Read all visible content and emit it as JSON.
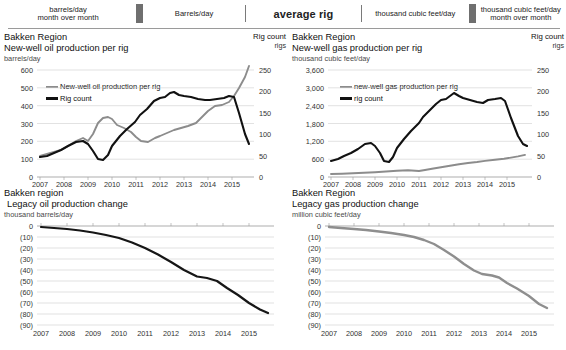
{
  "ribbon": {
    "cells": [
      {
        "label": "barrels/day\nmonth over month",
        "emphasis": false
      },
      {
        "label": "Barrels/day",
        "emphasis": false
      },
      {
        "label": "average rig",
        "emphasis": true
      },
      {
        "label": "thousand cubic feet/day",
        "emphasis": false
      },
      {
        "label": "thousand cubic feet/day\nmonth over month",
        "emphasis": false
      }
    ]
  },
  "panels": {
    "top_left": {
      "region": "Bakken Region",
      "title": "New-well oil production per rig",
      "unit": "barrels/day",
      "corner_title": "Rig count",
      "corner_unit": "rigs",
      "legend": [
        {
          "label": "New-well oil production per rig",
          "color": "#8c8c8c"
        },
        {
          "label": "Rig count",
          "color": "#111111"
        }
      ]
    },
    "top_right": {
      "region": "Bakken Region",
      "title": "New-well gas production per rig",
      "unit": "thousand cubic feet/day",
      "corner_title": "Rig count",
      "corner_unit": "rigs",
      "legend": [
        {
          "label": "new-well gas production per rig",
          "color": "#8c8c8c"
        },
        {
          "label": "rig count",
          "color": "#111111"
        }
      ]
    },
    "bottom_left": {
      "region": "Bakken region",
      "title": "Legacy oil production change",
      "unit": "thousand barrels/day"
    },
    "bottom_right": {
      "region": "Bakken Region",
      "title": "Legacy gas production change",
      "unit": "million cubic feet/day"
    }
  },
  "chart_data": [
    {
      "id": "new-well-oil-per-rig",
      "type": "line",
      "title": "Bakken Region New-well oil production per rig",
      "xlabel": "",
      "ylabel": "barrels/day",
      "y2label": "rigs",
      "xlim": [
        2007,
        2015.75
      ],
      "ylim": [
        0,
        600
      ],
      "y2lim": [
        0,
        250
      ],
      "xticks": [
        "2007",
        "2008",
        "2009",
        "2010",
        "2011",
        "2012",
        "2013",
        "2014",
        "2015"
      ],
      "yticks": [
        0,
        100,
        200,
        300,
        400,
        500,
        600
      ],
      "y2ticks": [
        0,
        50,
        100,
        150,
        200,
        250
      ],
      "grid": true,
      "legend_position": "upper-left",
      "series": [
        {
          "name": "New-well oil production per rig",
          "axis": "left",
          "color": "#8c8c8c",
          "x": [
            2007.0,
            2007.3,
            2007.6,
            2007.9,
            2008.2,
            2008.5,
            2008.8,
            2009.0,
            2009.2,
            2009.4,
            2009.6,
            2009.8,
            2010.0,
            2010.2,
            2010.5,
            2010.8,
            2011.0,
            2011.2,
            2011.5,
            2011.8,
            2012.0,
            2012.3,
            2012.6,
            2012.9,
            2013.2,
            2013.5,
            2013.8,
            2014.0,
            2014.3,
            2014.6,
            2014.9,
            2015.1,
            2015.3,
            2015.5,
            2015.7
          ],
          "y": [
            118,
            128,
            140,
            150,
            175,
            200,
            215,
            200,
            240,
            300,
            330,
            335,
            320,
            290,
            270,
            250,
            225,
            200,
            195,
            215,
            230,
            245,
            262,
            275,
            285,
            300,
            340,
            370,
            400,
            405,
            420,
            455,
            500,
            560,
            620
          ]
        },
        {
          "name": "Rig count",
          "axis": "right",
          "color": "#111111",
          "x": [
            2007.0,
            2007.3,
            2007.6,
            2007.9,
            2008.2,
            2008.5,
            2008.8,
            2009.0,
            2009.2,
            2009.4,
            2009.6,
            2009.8,
            2010.0,
            2010.3,
            2010.6,
            2010.9,
            2011.1,
            2011.4,
            2011.7,
            2012.0,
            2012.2,
            2012.4,
            2012.6,
            2012.8,
            2013.0,
            2013.3,
            2013.6,
            2013.9,
            2014.1,
            2014.4,
            2014.7,
            2014.9,
            2015.1,
            2015.3,
            2015.5,
            2015.7
          ],
          "y": [
            47,
            50,
            55,
            62,
            72,
            82,
            85,
            78,
            60,
            42,
            40,
            52,
            72,
            95,
            112,
            128,
            145,
            160,
            178,
            185,
            188,
            195,
            198,
            192,
            190,
            186,
            182,
            180,
            180,
            182,
            184,
            190,
            188,
            150,
            100,
            78
          ]
        }
      ]
    },
    {
      "id": "new-well-gas-per-rig",
      "type": "line",
      "title": "Bakken Region New-well gas production per rig",
      "xlabel": "",
      "ylabel": "thousand cubic feet/day",
      "y2label": "rigs",
      "xlim": [
        2007,
        2015.75
      ],
      "ylim": [
        0,
        3600
      ],
      "y2lim": [
        0,
        250
      ],
      "xticks": [
        "2007",
        "2008",
        "2009",
        "2010",
        "2011",
        "2012",
        "2013",
        "2014",
        "2015"
      ],
      "yticks": [
        0,
        600,
        1200,
        1800,
        2400,
        3000,
        3600
      ],
      "y2ticks": [
        0,
        50,
        100,
        150,
        200,
        250
      ],
      "grid": true,
      "legend_position": "upper-left",
      "series": [
        {
          "name": "new-well gas production per rig",
          "axis": "left",
          "color": "#8c8c8c",
          "x": [
            2007.0,
            2007.5,
            2008.0,
            2008.5,
            2009.0,
            2009.5,
            2010.0,
            2010.5,
            2011.0,
            2011.3,
            2011.6,
            2012.0,
            2012.4,
            2012.8,
            2013.2,
            2013.6,
            2014.0,
            2014.4,
            2014.8,
            2015.1,
            2015.4,
            2015.7
          ],
          "y": [
            100,
            110,
            125,
            140,
            160,
            185,
            210,
            225,
            200,
            230,
            280,
            330,
            380,
            430,
            470,
            500,
            540,
            580,
            610,
            650,
            690,
            740
          ]
        },
        {
          "name": "rig count",
          "axis": "right",
          "color": "#111111",
          "x": [
            2007.0,
            2007.3,
            2007.6,
            2007.9,
            2008.2,
            2008.5,
            2008.8,
            2009.0,
            2009.2,
            2009.4,
            2009.6,
            2009.8,
            2010.0,
            2010.3,
            2010.6,
            2010.9,
            2011.1,
            2011.4,
            2011.7,
            2012.0,
            2012.2,
            2012.4,
            2012.6,
            2012.8,
            2013.0,
            2013.3,
            2013.6,
            2013.9,
            2014.1,
            2014.4,
            2014.7,
            2014.9,
            2015.1,
            2015.3,
            2015.5,
            2015.7
          ],
          "y": [
            47,
            50,
            55,
            62,
            72,
            82,
            85,
            78,
            60,
            42,
            40,
            52,
            72,
            95,
            112,
            128,
            145,
            160,
            178,
            185,
            188,
            195,
            215,
            205,
            198,
            190,
            185,
            182,
            188,
            190,
            192,
            186,
            150,
            110,
            85,
            80
          ]
        }
      ]
    },
    {
      "id": "legacy-oil-production-change",
      "type": "line",
      "title": "Bakken region Legacy oil production change",
      "xlabel": "",
      "ylabel": "thousand barrels/day",
      "xlim": [
        2007,
        2015.75
      ],
      "ylim": [
        -90,
        0
      ],
      "xticks": [
        "2007",
        "2008",
        "2009",
        "2010",
        "2011",
        "2012",
        "2013",
        "2014",
        "2015"
      ],
      "yticks": [
        "0",
        "(10)",
        "(20)",
        "(30)",
        "(40)",
        "(50)",
        "(60)",
        "(70)",
        "(80)",
        "(90)"
      ],
      "grid": true,
      "series": [
        {
          "name": "Legacy oil production change",
          "color": "#161616",
          "x": [
            2007.0,
            2007.5,
            2008.0,
            2008.5,
            2009.0,
            2009.5,
            2010.0,
            2010.5,
            2011.0,
            2011.5,
            2012.0,
            2012.5,
            2013.0,
            2013.4,
            2013.8,
            2014.2,
            2014.6,
            2015.0,
            2015.4,
            2015.7
          ],
          "y": [
            -1,
            -2,
            -3,
            -4,
            -6,
            -8,
            -11,
            -15,
            -20,
            -26,
            -33,
            -40,
            -46,
            -47,
            -50,
            -57,
            -63,
            -70,
            -76,
            -79
          ]
        }
      ]
    },
    {
      "id": "legacy-gas-production-change",
      "type": "line",
      "title": "Bakken Region Legacy gas production change",
      "xlabel": "",
      "ylabel": "million cubic feet/day",
      "xlim": [
        2007,
        2015.75
      ],
      "ylim": [
        -90,
        0
      ],
      "xticks": [
        "2007",
        "2008",
        "2009",
        "2010",
        "2011",
        "2012",
        "2013",
        "2014",
        "2015"
      ],
      "yticks": [
        "0",
        "(10)",
        "(20)",
        "(30)",
        "(40)",
        "(50)",
        "(60)",
        "(70)",
        "(80)",
        "(90)"
      ],
      "grid": true,
      "series": [
        {
          "name": "Legacy gas production change",
          "color": "#8e8e8e",
          "x": [
            2007.0,
            2007.5,
            2008.0,
            2008.5,
            2009.0,
            2009.5,
            2010.0,
            2010.4,
            2010.8,
            2011.2,
            2011.6,
            2012.0,
            2012.4,
            2012.8,
            2013.1,
            2013.5,
            2013.8,
            2014.1,
            2014.5,
            2015.0,
            2015.4,
            2015.7
          ],
          "y": [
            -1,
            -2,
            -3,
            -4,
            -5,
            -6,
            -8,
            -10,
            -12,
            -16,
            -21,
            -27,
            -34,
            -40,
            -44,
            -45,
            -47,
            -52,
            -57,
            -64,
            -71,
            -75
          ]
        }
      ]
    }
  ]
}
